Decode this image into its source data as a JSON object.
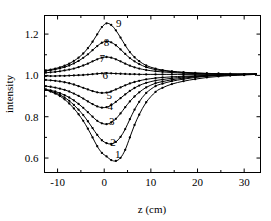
{
  "chart_data": {
    "type": "line",
    "title": "",
    "subtitle": "",
    "xlabel": "z (cm)",
    "ylabel": "intensity",
    "xlim": [
      -12.8,
      33.5
    ],
    "ylim": [
      0.53,
      1.29
    ],
    "xticks": [
      -10,
      0,
      10,
      20,
      30
    ],
    "xticklabels": [
      "-10",
      "0",
      "10",
      "20",
      "30"
    ],
    "xminorticks": [
      -5,
      5,
      15,
      25
    ],
    "yticks": [
      0.6,
      0.8,
      1.0,
      1.2
    ],
    "yticklabels": [
      "0.6",
      "0.8",
      "1.0",
      "1.2"
    ],
    "yminorticks": [
      0.7,
      0.9,
      1.1,
      1.3
    ],
    "grid": false,
    "legend": "inline-curve-labels",
    "marker": "filled-circle",
    "line_color": "#000000",
    "background": "#ffffff",
    "annotations": [
      {
        "label": "1",
        "x": 2.9,
        "y": 0.6
      },
      {
        "label": "2",
        "x": 1.9,
        "y": 0.66
      },
      {
        "label": "3",
        "x": 1.6,
        "y": 0.762
      },
      {
        "label": "4",
        "x": 1.3,
        "y": 0.832
      },
      {
        "label": "5",
        "x": 1.1,
        "y": 0.888
      },
      {
        "label": "6",
        "x": 0.2,
        "y": 0.982
      },
      {
        "label": "7",
        "x": -0.4,
        "y": 1.065
      },
      {
        "label": "8",
        "x": 0.5,
        "y": 1.143
      },
      {
        "label": "9",
        "x": 3.1,
        "y": 1.232
      }
    ],
    "series": [
      {
        "name": "1",
        "x": [
          -12.5,
          -11.5,
          -10.5,
          -9.5,
          -8.5,
          -7.5,
          -6.5,
          -5.5,
          -4.5,
          -3.5,
          -2.5,
          -1.5,
          -0.5,
          0.5,
          1.5,
          2.5,
          3.5,
          4.5,
          5.5,
          6.5,
          7.5,
          9.0,
          11.0,
          12.5,
          14.5,
          17.0,
          19.5,
          22.0,
          24.5,
          27.0,
          30.0,
          32.5
        ],
        "y": [
          0.93,
          0.922,
          0.912,
          0.9,
          0.884,
          0.864,
          0.84,
          0.812,
          0.78,
          0.742,
          0.7,
          0.657,
          0.625,
          0.608,
          0.59,
          0.586,
          0.601,
          0.64,
          0.7,
          0.76,
          0.81,
          0.87,
          0.92,
          0.94,
          0.958,
          0.972,
          0.982,
          0.99,
          0.995,
          0.999,
          1.002,
          1.005
        ]
      },
      {
        "name": "2",
        "x": [
          -12.5,
          -11.5,
          -10.5,
          -9.5,
          -8.5,
          -7.5,
          -6.5,
          -5.5,
          -4.5,
          -3.5,
          -2.5,
          -1.5,
          -0.5,
          0.5,
          1.5,
          2.5,
          3.5,
          4.5,
          5.5,
          6.5,
          7.5,
          9.0,
          11.0,
          12.5,
          14.5,
          17.0,
          19.5,
          22.0,
          24.5,
          27.0,
          30.0,
          32.5
        ],
        "y": [
          0.93,
          0.924,
          0.916,
          0.906,
          0.893,
          0.877,
          0.857,
          0.834,
          0.808,
          0.778,
          0.745,
          0.712,
          0.686,
          0.672,
          0.668,
          0.678,
          0.702,
          0.74,
          0.788,
          0.834,
          0.872,
          0.915,
          0.948,
          0.96,
          0.972,
          0.982,
          0.99,
          0.996,
          1.0,
          1.002,
          1.004,
          1.006
        ]
      },
      {
        "name": "3",
        "x": [
          -12.5,
          -11.5,
          -10.5,
          -9.5,
          -8.5,
          -7.5,
          -6.5,
          -5.5,
          -4.5,
          -3.5,
          -2.5,
          -1.5,
          -0.5,
          0.5,
          1.5,
          2.5,
          3.5,
          4.5,
          5.5,
          6.5,
          7.5,
          9.0,
          11.0,
          12.5,
          14.5,
          17.0,
          19.5,
          22.0,
          24.5,
          27.0,
          30.0,
          32.5
        ],
        "y": [
          0.932,
          0.928,
          0.922,
          0.914,
          0.905,
          0.893,
          0.879,
          0.862,
          0.843,
          0.822,
          0.8,
          0.78,
          0.768,
          0.764,
          0.772,
          0.79,
          0.816,
          0.846,
          0.874,
          0.898,
          0.918,
          0.942,
          0.962,
          0.97,
          0.979,
          0.987,
          0.993,
          0.997,
          1.0,
          1.002,
          1.004,
          1.006
        ]
      },
      {
        "name": "4",
        "x": [
          -12.5,
          -11.5,
          -10.5,
          -9.5,
          -8.5,
          -7.5,
          -6.5,
          -5.5,
          -4.5,
          -3.5,
          -2.5,
          -1.5,
          -0.5,
          0.5,
          1.5,
          2.5,
          3.5,
          4.5,
          5.5,
          6.5,
          7.5,
          9.0,
          11.0,
          12.5,
          14.5,
          17.0,
          19.5,
          22.0,
          24.5,
          27.0,
          30.0,
          32.5
        ],
        "y": [
          0.948,
          0.945,
          0.941,
          0.936,
          0.93,
          0.922,
          0.912,
          0.901,
          0.888,
          0.874,
          0.861,
          0.85,
          0.844,
          0.846,
          0.856,
          0.872,
          0.89,
          0.908,
          0.925,
          0.939,
          0.951,
          0.964,
          0.975,
          0.98,
          0.986,
          0.992,
          0.996,
          0.999,
          1.001,
          1.003,
          1.005,
          1.006
        ]
      },
      {
        "name": "5",
        "x": [
          -12.5,
          -11.5,
          -10.5,
          -9.5,
          -8.5,
          -7.5,
          -6.5,
          -5.5,
          -4.5,
          -3.5,
          -2.5,
          -1.5,
          -0.5,
          0.5,
          1.5,
          2.5,
          3.5,
          4.5,
          5.5,
          6.5,
          7.5,
          9.0,
          11.0,
          12.5,
          14.5,
          17.0,
          19.5,
          22.0,
          24.5,
          27.0,
          30.0,
          32.5
        ],
        "y": [
          0.978,
          0.976,
          0.974,
          0.971,
          0.967,
          0.962,
          0.956,
          0.948,
          0.94,
          0.932,
          0.924,
          0.918,
          0.915,
          0.917,
          0.923,
          0.932,
          0.942,
          0.952,
          0.961,
          0.968,
          0.974,
          0.981,
          0.987,
          0.99,
          0.993,
          0.996,
          0.998,
          1.0,
          1.002,
          1.003,
          1.005,
          1.006
        ]
      },
      {
        "name": "6",
        "x": [
          -12.5,
          -11.5,
          -10.5,
          -9.5,
          -8.5,
          -7.5,
          -6.5,
          -5.5,
          -4.5,
          -3.5,
          -2.5,
          -1.5,
          -0.5,
          0.5,
          1.5,
          2.5,
          3.5,
          4.5,
          5.5,
          6.5,
          7.5,
          9.0,
          11.0,
          12.5,
          14.5,
          17.0,
          19.5,
          22.0,
          24.5,
          27.0,
          30.0,
          32.5
        ],
        "y": [
          0.997,
          0.997,
          0.997,
          0.998,
          0.998,
          0.999,
          1.0,
          1.001,
          1.002,
          1.004,
          1.006,
          1.008,
          1.01,
          1.011,
          1.01,
          1.009,
          1.008,
          1.007,
          1.006,
          1.006,
          1.005,
          1.005,
          1.005,
          1.005,
          1.005,
          1.005,
          1.005,
          1.005,
          1.005,
          1.005,
          1.006,
          1.006
        ]
      },
      {
        "name": "7",
        "x": [
          -12.5,
          -11.5,
          -10.5,
          -9.5,
          -8.5,
          -7.5,
          -6.5,
          -5.5,
          -4.5,
          -3.5,
          -2.5,
          -1.5,
          -0.5,
          0.5,
          1.5,
          2.5,
          3.5,
          4.5,
          5.5,
          6.5,
          7.5,
          9.0,
          11.0,
          12.5,
          14.5,
          17.0,
          19.5,
          22.0,
          24.5,
          27.0,
          30.0,
          32.5
        ],
        "y": [
          1.013,
          1.015,
          1.017,
          1.02,
          1.024,
          1.028,
          1.033,
          1.04,
          1.048,
          1.057,
          1.068,
          1.078,
          1.086,
          1.089,
          1.086,
          1.078,
          1.068,
          1.057,
          1.047,
          1.039,
          1.033,
          1.026,
          1.02,
          1.017,
          1.014,
          1.011,
          1.009,
          1.008,
          1.007,
          1.006,
          1.006,
          1.006
        ]
      },
      {
        "name": "8",
        "x": [
          -12.5,
          -11.5,
          -10.5,
          -9.5,
          -8.5,
          -7.5,
          -6.5,
          -5.5,
          -4.5,
          -3.5,
          -2.5,
          -1.5,
          -0.5,
          0.5,
          1.5,
          2.5,
          3.5,
          4.5,
          5.5,
          6.5,
          7.5,
          9.0,
          11.0,
          12.5,
          14.5,
          17.0,
          19.5,
          22.0,
          24.5,
          27.0,
          30.0,
          32.5
        ],
        "y": [
          1.022,
          1.025,
          1.029,
          1.034,
          1.04,
          1.048,
          1.058,
          1.07,
          1.085,
          1.102,
          1.122,
          1.142,
          1.158,
          1.165,
          1.16,
          1.146,
          1.126,
          1.104,
          1.084,
          1.068,
          1.055,
          1.04,
          1.028,
          1.023,
          1.018,
          1.014,
          1.011,
          1.009,
          1.008,
          1.007,
          1.006,
          1.006
        ]
      },
      {
        "name": "9",
        "x": [
          -12.5,
          -11.5,
          -10.5,
          -9.5,
          -8.5,
          -7.5,
          -6.5,
          -5.5,
          -4.5,
          -3.5,
          -2.5,
          -1.5,
          -0.5,
          0.5,
          1.5,
          2.5,
          3.5,
          4.5,
          5.5,
          6.5,
          7.5,
          9.0,
          11.0,
          12.5,
          14.5,
          17.0,
          19.5,
          22.0,
          24.5,
          27.0,
          30.0,
          32.5
        ],
        "y": [
          1.024,
          1.028,
          1.033,
          1.039,
          1.047,
          1.057,
          1.07,
          1.086,
          1.106,
          1.132,
          1.163,
          1.199,
          1.234,
          1.252,
          1.244,
          1.218,
          1.183,
          1.146,
          1.113,
          1.088,
          1.069,
          1.048,
          1.033,
          1.026,
          1.02,
          1.015,
          1.012,
          1.01,
          1.008,
          1.007,
          1.006,
          1.006
        ]
      }
    ]
  },
  "axis": {
    "xlabel": "z (cm)",
    "ylabel": "intensity"
  }
}
